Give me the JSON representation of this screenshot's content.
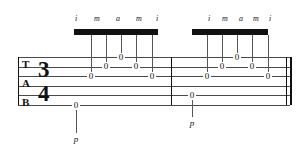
{
  "notation": {
    "type": "guitar-tablature",
    "clef_letters": [
      "T",
      "A",
      "B"
    ],
    "time_signature": {
      "numerator": "3",
      "upper": "3",
      "lower": "4",
      "denominator": "4"
    },
    "string_count": 6,
    "measure_count": 2,
    "end_barline": "double",
    "colors": {
      "staff_line": "#4a4a4a",
      "ink": "#111111",
      "beam": "#111111",
      "stem": "#555555",
      "background": "#ffffff"
    },
    "staff": {
      "left": 18,
      "right": 290,
      "top": 57,
      "line_spacing": 9.6
    },
    "measures": [
      {
        "index": 1,
        "barline_x": 171,
        "beam": {
          "x": 74,
          "width": 84,
          "y": 29,
          "height": 6
        },
        "fingerings": [
          {
            "label": "i",
            "x": 76,
            "y": 15
          },
          {
            "label": "m",
            "x": 97,
            "y": 15
          },
          {
            "label": "a",
            "x": 118,
            "y": 15
          },
          {
            "label": "m",
            "x": 139,
            "y": 15
          },
          {
            "label": "i",
            "x": 157,
            "y": 15
          }
        ],
        "thumb": {
          "label": "p",
          "x": 76,
          "y": 135
        },
        "notes": [
          {
            "fret": "0",
            "string": 6,
            "x": 76,
            "voice": "bass",
            "finger": "p"
          },
          {
            "fret": "0",
            "string": 3,
            "x": 91,
            "voice": "melody",
            "finger": "i"
          },
          {
            "fret": "0",
            "string": 2,
            "x": 106,
            "voice": "melody",
            "finger": "m"
          },
          {
            "fret": "0",
            "string": 1,
            "x": 121,
            "voice": "melody",
            "finger": "a"
          },
          {
            "fret": "0",
            "string": 2,
            "x": 136,
            "voice": "melody",
            "finger": "m"
          },
          {
            "fret": "0",
            "string": 3,
            "x": 152,
            "voice": "melody",
            "finger": "i"
          }
        ]
      },
      {
        "index": 2,
        "barline_x": 286,
        "beam": {
          "x": 192,
          "width": 76,
          "y": 29,
          "height": 6
        },
        "fingerings": [
          {
            "label": "i",
            "x": 209,
            "y": 15
          },
          {
            "label": "m",
            "x": 225,
            "y": 15
          },
          {
            "label": "a",
            "x": 241,
            "y": 15
          },
          {
            "label": "m",
            "x": 256,
            "y": 15
          },
          {
            "label": "i",
            "x": 270,
            "y": 15
          }
        ],
        "thumb": {
          "label": "p",
          "x": 192,
          "y": 119
        },
        "notes": [
          {
            "fret": "0",
            "string": 5,
            "x": 192,
            "voice": "bass",
            "finger": "p"
          },
          {
            "fret": "0",
            "string": 3,
            "x": 207,
            "voice": "melody",
            "finger": "i"
          },
          {
            "fret": "0",
            "string": 2,
            "x": 222,
            "voice": "melody",
            "finger": "m"
          },
          {
            "fret": "0",
            "string": 1,
            "x": 237,
            "voice": "melody",
            "finger": "a"
          },
          {
            "fret": "0",
            "string": 2,
            "x": 252,
            "voice": "melody",
            "finger": "m"
          },
          {
            "fret": "0",
            "string": 3,
            "x": 268,
            "voice": "melody",
            "finger": "i"
          }
        ]
      }
    ]
  }
}
